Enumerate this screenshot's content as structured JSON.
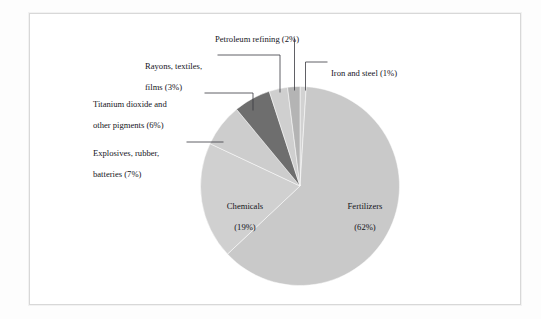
{
  "figure": {
    "background_color": "#fdfdfd",
    "panel_color": "#ffffff",
    "border_color": "#d8d8d8"
  },
  "chart_data": {
    "type": "pie",
    "title": "",
    "subtitle": "",
    "xlabel": "",
    "ylabel": "",
    "legend_position": "none",
    "grid": false,
    "units": "percent",
    "start_angle_deg": 0,
    "direction": "clockwise",
    "categories": [
      "Iron and steel",
      "Fertilizers",
      "Chemicals",
      "Explosives, rubber, batteries",
      "Titanium dioxide and other pigments",
      "Rayons, textiles, films",
      "Petroleum refining"
    ],
    "values": [
      1,
      62,
      19,
      7,
      6,
      3,
      2
    ],
    "slices": [
      {
        "name": "Iron and steel",
        "value": 1,
        "value_text": "(1%)",
        "label": "Iron and steel (1%)",
        "color": "#d2d2d2",
        "label_placement": "callout-right"
      },
      {
        "name": "Fertilizers",
        "value": 62,
        "value_text": "(62%)",
        "label_line1": "Fertilizers",
        "label_line2": "(62%)",
        "color": "#c9c9c9",
        "label_placement": "inside"
      },
      {
        "name": "Chemicals",
        "value": 19,
        "value_text": "(19%)",
        "label_line1": "Chemicals",
        "label_line2": "(19%)",
        "color": "#d0d0d0",
        "label_placement": "inside"
      },
      {
        "name": "Explosives, rubber, batteries",
        "value": 7,
        "value_text": "(7%)",
        "label_line1": "Explosives, rubber,",
        "label_line2": "batteries (7%)",
        "color": "#cdcdcd",
        "label_placement": "callout-left"
      },
      {
        "name": "Titanium dioxide and other pigments",
        "value": 6,
        "value_text": "(6%)",
        "label_line1": "Titanium dioxide and",
        "label_line2": "other pigments (6%)",
        "color": "#6e6e6e",
        "label_placement": "callout-left"
      },
      {
        "name": "Rayons, textiles, films",
        "value": 3,
        "value_text": "(3%)",
        "label_line1": "Rayons, textiles,",
        "label_line2": "films (3%)",
        "color": "#cfcfcf",
        "label_placement": "callout-left"
      },
      {
        "name": "Petroleum refining",
        "value": 2,
        "value_text": "(2%)",
        "label": "Petroleum refining (2%)",
        "color": "#b4b4b4",
        "label_placement": "callout-top"
      }
    ]
  },
  "labels": {
    "petroleum": "Petroleum refining (2%)",
    "iron_and_steel": "Iron and steel (1%)",
    "rayons_l1": "Rayons, textiles,",
    "rayons_l2": "films (3%)",
    "titanium_l1": "Titanium dioxide and",
    "titanium_l2": "other pigments (6%)",
    "explosives_l1": "Explosives, rubber,",
    "explosives_l2": "batteries (7%)",
    "chemicals_l1": "Chemicals",
    "chemicals_l2": "(19%)",
    "fertilizers_l1": "Fertilizers",
    "fertilizers_l2": "(62%)"
  }
}
